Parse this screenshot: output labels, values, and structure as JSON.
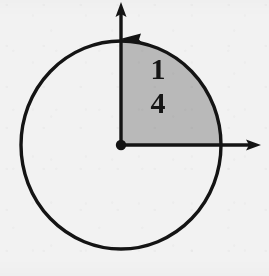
{
  "figure": {
    "background_color": "#f2f2f2",
    "stroke_color": "#141414",
    "shaded_color": "#b9b9b9",
    "label": {
      "numerator": "1",
      "denominator": "4",
      "text": "1/4",
      "value": 0.25
    },
    "geometry": {
      "center_x": 121,
      "center_y": 145,
      "radius_x": 100,
      "radius_y": 104,
      "shaded_start_angle_deg": 0,
      "shaded_end_angle_deg": 90,
      "shaded_fraction": "1/4"
    },
    "axes": {
      "x_axis_label": "",
      "y_axis_label": "",
      "x_arrow_direction": "right",
      "y_arrow_direction": "up"
    },
    "arc_arrow": {
      "direction": "counterclockwise",
      "position": "top"
    }
  }
}
